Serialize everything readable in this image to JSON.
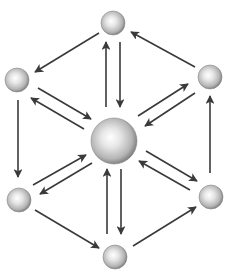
{
  "diagram": {
    "type": "hub-and-ring network",
    "colors": {
      "background": "#ffffff",
      "arrow": "#3a3a3a",
      "node_highlight": "#ffffff",
      "node_mid": "#c8c8c8",
      "node_edge": "#6e6e6e"
    },
    "nodes": [
      {
        "id": "center",
        "x": 114,
        "y": 141,
        "r": 23
      },
      {
        "id": "top",
        "x": 113,
        "y": 23,
        "r": 12
      },
      {
        "id": "upper-left",
        "x": 17,
        "y": 80,
        "r": 12
      },
      {
        "id": "upper-right",
        "x": 210,
        "y": 77,
        "r": 12
      },
      {
        "id": "lower-left",
        "x": 19,
        "y": 200,
        "r": 12
      },
      {
        "id": "lower-right",
        "x": 211,
        "y": 197,
        "r": 12
      },
      {
        "id": "bottom",
        "x": 115,
        "y": 257,
        "r": 12
      }
    ],
    "ring_edges": [
      {
        "from": "top",
        "to": "upper-left",
        "x1": 99,
        "y1": 33,
        "x2": 35,
        "y2": 72
      },
      {
        "from": "upper-left",
        "to": "lower-left",
        "x1": 18,
        "y1": 100,
        "x2": 18,
        "y2": 177
      },
      {
        "from": "lower-left",
        "to": "bottom",
        "x1": 35,
        "y1": 210,
        "x2": 99,
        "y2": 248
      },
      {
        "from": "bottom",
        "to": "lower-right",
        "x1": 133,
        "y1": 246,
        "x2": 196,
        "y2": 207
      },
      {
        "from": "lower-right",
        "to": "upper-right",
        "x1": 210,
        "y1": 173,
        "x2": 210,
        "y2": 96
      },
      {
        "from": "upper-right",
        "to": "top",
        "x1": 195,
        "y1": 67,
        "x2": 131,
        "y2": 32
      }
    ],
    "spoke_edges": [
      {
        "from": "center",
        "to": "top",
        "x1": 106,
        "y1": 107,
        "x2": 106,
        "y2": 42
      },
      {
        "from": "top",
        "to": "center",
        "x1": 120,
        "y1": 42,
        "x2": 120,
        "y2": 107
      },
      {
        "from": "bottom",
        "to": "center",
        "x1": 107,
        "y1": 234,
        "x2": 107,
        "y2": 169
      },
      {
        "from": "center",
        "to": "bottom",
        "x1": 121,
        "y1": 169,
        "x2": 121,
        "y2": 234
      },
      {
        "from": "upper-left",
        "to": "center",
        "x1": 38,
        "y1": 88,
        "x2": 91,
        "y2": 119
      },
      {
        "from": "center",
        "to": "upper-left",
        "x1": 84,
        "y1": 129,
        "x2": 31,
        "y2": 98
      },
      {
        "from": "center",
        "to": "upper-right",
        "x1": 138,
        "y1": 116,
        "x2": 188,
        "y2": 84
      },
      {
        "from": "upper-right",
        "to": "center",
        "x1": 195,
        "y1": 93,
        "x2": 145,
        "y2": 126
      },
      {
        "from": "lower-left",
        "to": "center",
        "x1": 33,
        "y1": 185,
        "x2": 86,
        "y2": 155
      },
      {
        "from": "center",
        "to": "lower-left",
        "x1": 92,
        "y1": 163,
        "x2": 40,
        "y2": 194
      },
      {
        "from": "center",
        "to": "lower-right",
        "x1": 146,
        "y1": 151,
        "x2": 197,
        "y2": 181
      },
      {
        "from": "lower-right",
        "to": "center",
        "x1": 190,
        "y1": 190,
        "x2": 139,
        "y2": 161
      }
    ]
  }
}
